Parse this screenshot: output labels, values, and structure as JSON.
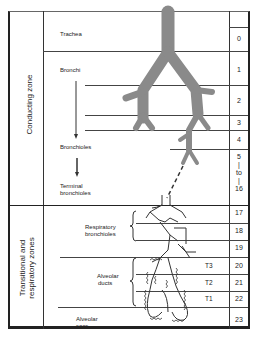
{
  "zones": {
    "conducting": "Conducting zone",
    "transitional_line1": "Transitional and",
    "transitional_line2": "respiratory zones"
  },
  "structures": [
    {
      "label_line1": "Trachea",
      "label_line2": ""
    },
    {
      "label_line1": "Bronchi",
      "label_line2": ""
    },
    {
      "label_line1": "Bronchioles",
      "label_line2": ""
    },
    {
      "label_line1": "Terminal",
      "label_line2": "bronchioles"
    },
    {
      "label_line1": "Respiratory",
      "label_line2": "bronchioles"
    },
    {
      "label_line1": "Alveolar",
      "label_line2": "ducts"
    },
    {
      "label_line1": "Alveolar",
      "label_line2": "sacs"
    }
  ],
  "generations": [
    "0",
    "1",
    "2",
    "3",
    "4",
    "5",
    "|",
    "to",
    "|",
    "16",
    "17",
    "18",
    "19",
    "20",
    "21",
    "22",
    "23"
  ],
  "transitional_labels": [
    "T3",
    "T2",
    "T1"
  ],
  "colors": {
    "airway_fill": "#8a8a8a",
    "lines": "#333333",
    "background": "#ffffff"
  }
}
